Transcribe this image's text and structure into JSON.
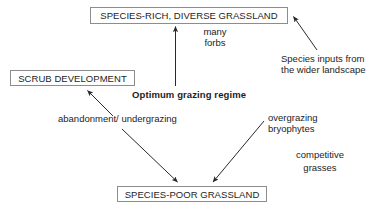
{
  "diagram": {
    "theme": {
      "background": "#ffffff",
      "text_color": "#1d1d1d",
      "box_border": "#8d8d8d",
      "arrow_color": "#2a2a2a"
    },
    "nodes": [
      {
        "id": "species-rich",
        "label": "SPECIES-RICH, DIVERSE GRASSLAND"
      },
      {
        "id": "scrub",
        "label": "SCRUB DEVELOPMENT"
      },
      {
        "id": "species-poor",
        "label": "SPECIES-POOR GRASSLAND"
      }
    ],
    "labels": [
      {
        "id": "many-forbs",
        "line1": "many",
        "line2": "forbs"
      },
      {
        "id": "species-inputs",
        "line1": "Species inputs from",
        "line2": "the wider landscape"
      },
      {
        "id": "optimum-grazing",
        "text": "Optimum grazing regime"
      },
      {
        "id": "abandonment",
        "text": "abandonment/ undergrazing"
      },
      {
        "id": "overgrazing",
        "line1": "overgrazing",
        "line2": "bryophytes"
      },
      {
        "id": "competitive-grasses",
        "line1": "competitive",
        "line2": "grasses"
      }
    ],
    "arrows": [
      {
        "id": "optimum-to-species-rich",
        "from": "Optimum grazing regime",
        "to": "SPECIES-RICH, DIVERSE GRASSLAND"
      },
      {
        "id": "species-inputs-to-species-rich",
        "from": "Species inputs from the wider landscape",
        "to": "SPECIES-RICH, DIVERSE GRASSLAND"
      },
      {
        "id": "abandonment-to-scrub",
        "from": "abandonment/ undergrazing",
        "to": "SCRUB DEVELOPMENT"
      },
      {
        "id": "abandonment-to-species-poor",
        "from": "abandonment/ undergrazing",
        "to": "SPECIES-POOR GRASSLAND"
      },
      {
        "id": "overgrazing-to-species-poor",
        "from": "overgrazing bryophytes",
        "to": "SPECIES-POOR GRASSLAND"
      }
    ]
  }
}
